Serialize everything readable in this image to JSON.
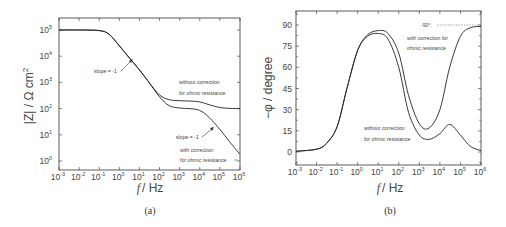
{
  "chart_data": [
    {
      "type": "line",
      "panel_label": "(a)",
      "title": "",
      "xlabel": "f / Hz",
      "ylabel": "|Z| / Ω cm²",
      "xscale": "log",
      "yscale": "log",
      "xlim": [
        0.001,
        1000000
      ],
      "ylim": [
        0.5,
        300000
      ],
      "x_tick_labels": [
        "10^-3",
        "10^-2",
        "10^-1",
        "10^0",
        "10^1",
        "10^2",
        "10^3",
        "10^4",
        "10^5",
        "10^6"
      ],
      "y_tick_labels": [
        "10^0",
        "10^1",
        "10^2",
        "10^3",
        "10^4",
        "10^5"
      ],
      "grid": false,
      "series": [
        {
          "name": "without correction for ohmic resistance",
          "x": [
            0.001,
            0.01,
            0.1,
            0.3,
            1,
            3,
            10,
            30,
            100,
            300,
            1000,
            3000,
            10000,
            30000,
            100000,
            300000,
            1000000
          ],
          "values": [
            100000,
            100000,
            95000,
            70000,
            25000,
            9000,
            3000,
            1000,
            330,
            220,
            200,
            195,
            180,
            140,
            110,
            102,
            100
          ]
        },
        {
          "name": "with correction for ohmic resistance",
          "x": [
            0.001,
            0.01,
            0.1,
            0.3,
            1,
            3,
            10,
            30,
            100,
            300,
            1000,
            3000,
            10000,
            30000,
            100000,
            300000,
            1000000
          ],
          "values": [
            100000,
            100000,
            95000,
            70000,
            25000,
            9000,
            3000,
            1000,
            280,
            130,
            105,
            100,
            85,
            45,
            16,
            5.5,
            1.8
          ]
        }
      ],
      "annotations": [
        {
          "text": "slope = -1",
          "at_x": 5,
          "at_y": 7000
        },
        {
          "text": "slope = -1",
          "at_x": 80000,
          "at_y": 20
        },
        {
          "text": "without correction for ohmic resistance"
        },
        {
          "text": "with correction for ohmic resistance"
        }
      ]
    },
    {
      "type": "line",
      "panel_label": "(b)",
      "title": "",
      "xlabel": "f / Hz",
      "ylabel": "-φ / degree",
      "xscale": "log",
      "yscale": "linear",
      "xlim": [
        0.001,
        1000000
      ],
      "ylim": [
        -10,
        100
      ],
      "x_tick_labels": [
        "10^-3",
        "10^-2",
        "10^-1",
        "10^0",
        "10^1",
        "10^2",
        "10^3",
        "10^4",
        "10^5",
        "10^6"
      ],
      "y_tick_labels": [
        "0",
        "15",
        "30",
        "45",
        "60",
        "75",
        "90"
      ],
      "grid": false,
      "series": [
        {
          "name": "with correction for ohmic resistance",
          "x": [
            0.001,
            0.01,
            0.03,
            0.1,
            0.3,
            1,
            3,
            10,
            30,
            100,
            300,
            1000,
            3000,
            10000,
            30000,
            100000,
            300000,
            1000000
          ],
          "values": [
            0.5,
            2,
            6,
            18,
            45,
            72,
            83,
            86,
            84,
            70,
            40,
            20,
            17,
            30,
            60,
            82,
            88,
            89
          ]
        },
        {
          "name": "without correction for ohmic resistance",
          "x": [
            0.001,
            0.01,
            0.03,
            0.1,
            0.3,
            1,
            3,
            10,
            30,
            100,
            300,
            1000,
            3000,
            10000,
            30000,
            100000,
            300000,
            1000000
          ],
          "values": [
            0.5,
            2,
            6,
            18,
            45,
            72,
            82,
            84,
            80,
            60,
            28,
            12,
            9,
            13,
            19.5,
            12,
            4,
            1
          ]
        }
      ],
      "annotations": [
        {
          "text": "-90°",
          "reference_line_y": 90
        },
        {
          "text": "with correction for ohmic resistance"
        },
        {
          "text": "without correction for ohmic resistance"
        }
      ]
    }
  ],
  "panel_a": {
    "caption": "(a)",
    "xlabel": "/ Hz",
    "xlabel_italic": "f",
    "ylabel": "|Z| / Ω cm",
    "ylabel_sup": "2",
    "y_ticks": [
      {
        "base": "10",
        "exp": "5"
      },
      {
        "base": "10",
        "exp": "4"
      },
      {
        "base": "10",
        "exp": "3"
      },
      {
        "base": "10",
        "exp": "2"
      },
      {
        "base": "10",
        "exp": "1"
      },
      {
        "base": "10",
        "exp": "0"
      }
    ],
    "x_ticks": [
      {
        "base": "10",
        "exp": "-3"
      },
      {
        "base": "10",
        "exp": "-2"
      },
      {
        "base": "10",
        "exp": "-1"
      },
      {
        "base": "10",
        "exp": "0"
      },
      {
        "base": "10",
        "exp": "1"
      },
      {
        "base": "10",
        "exp": "2"
      },
      {
        "base": "10",
        "exp": "3"
      },
      {
        "base": "10",
        "exp": "4"
      },
      {
        "base": "10",
        "exp": "5"
      },
      {
        "base": "10",
        "exp": "6"
      }
    ],
    "ann_slope1": "slope = -1",
    "ann_slope2": "slope = -1",
    "ann_without_1": "without correction",
    "ann_without_2": "for ohmic resistance",
    "ann_with_1": "with correction",
    "ann_with_2": "for ohmic resistance"
  },
  "panel_b": {
    "caption": "(b)",
    "xlabel": "/ Hz",
    "xlabel_italic": "f",
    "ylabel": "−φ / degree",
    "y_ticks": [
      "90",
      "75",
      "60",
      "45",
      "30",
      "15",
      "0"
    ],
    "x_ticks": [
      {
        "base": "10",
        "exp": "-3"
      },
      {
        "base": "10",
        "exp": "-2"
      },
      {
        "base": "10",
        "exp": "-1"
      },
      {
        "base": "10",
        "exp": "0"
      },
      {
        "base": "10",
        "exp": "1"
      },
      {
        "base": "10",
        "exp": "2"
      },
      {
        "base": "10",
        "exp": "3"
      },
      {
        "base": "10",
        "exp": "4"
      },
      {
        "base": "10",
        "exp": "5"
      },
      {
        "base": "10",
        "exp": "6"
      }
    ],
    "ann_90": "-90°",
    "ann_with_1": "with correction for",
    "ann_with_2": "ohmic resistance",
    "ann_without_1": "without correction",
    "ann_without_2": "for ohmic resistance"
  },
  "colors": {
    "line": "#222222",
    "frame": "#333333",
    "text": "#444444"
  }
}
